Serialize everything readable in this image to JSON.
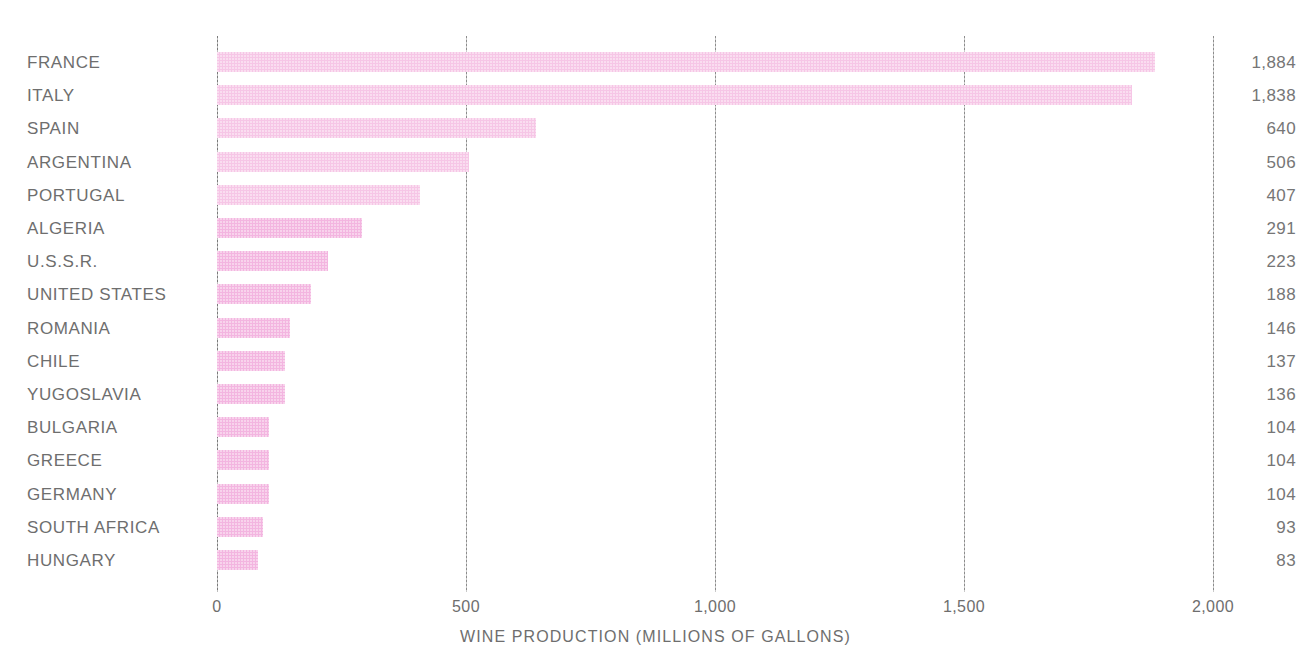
{
  "chart_data": {
    "type": "bar",
    "orientation": "horizontal",
    "title": "",
    "xlabel": "WINE PRODUCTION (MILLIONS OF GALLONS)",
    "ylabel": "",
    "xlim": [
      0,
      2000
    ],
    "xticks": [
      0,
      500,
      1000,
      1500,
      2000
    ],
    "xtick_labels": [
      "0",
      "500",
      "1,000",
      "1,500",
      "2,000"
    ],
    "grid": true,
    "grid_axis": "x",
    "legend": false,
    "value_labels_position": "right-of-plot",
    "bar_color": "#f3b5e0",
    "text_color": "#6e6e6e",
    "categories": [
      "FRANCE",
      "ITALY",
      "SPAIN",
      "ARGENTINA",
      "PORTUGAL",
      "ALGERIA",
      "U.S.S.R.",
      "UNITED STATES",
      "ROMANIA",
      "CHILE",
      "YUGOSLAVIA",
      "BULGARIA",
      "GREECE",
      "GERMANY",
      "SOUTH AFRICA",
      "HUNGARY"
    ],
    "values": [
      1884,
      1838,
      640,
      506,
      407,
      291,
      223,
      188,
      146,
      137,
      136,
      104,
      104,
      104,
      93,
      83
    ],
    "value_labels": [
      "1,884",
      "1,838",
      "640",
      "506",
      "407",
      "291",
      "223",
      "188",
      "146",
      "137",
      "136",
      "104",
      "104",
      "104",
      "93",
      "83"
    ],
    "rows": [
      {
        "label": "FRANCE",
        "value": 1884,
        "value_label": "1,884"
      },
      {
        "label": "ITALY",
        "value": 1838,
        "value_label": "1,838"
      },
      {
        "label": "SPAIN",
        "value": 640,
        "value_label": "640"
      },
      {
        "label": "ARGENTINA",
        "value": 506,
        "value_label": "506"
      },
      {
        "label": "PORTUGAL",
        "value": 407,
        "value_label": "407"
      },
      {
        "label": "ALGERIA",
        "value": 291,
        "value_label": "291"
      },
      {
        "label": "U.S.S.R.",
        "value": 223,
        "value_label": "223"
      },
      {
        "label": "UNITED STATES",
        "value": 188,
        "value_label": "188"
      },
      {
        "label": "ROMANIA",
        "value": 146,
        "value_label": "146"
      },
      {
        "label": "CHILE",
        "value": 137,
        "value_label": "137"
      },
      {
        "label": "YUGOSLAVIA",
        "value": 136,
        "value_label": "136"
      },
      {
        "label": "BULGARIA",
        "value": 104,
        "value_label": "104"
      },
      {
        "label": "GREECE",
        "value": 104,
        "value_label": "104"
      },
      {
        "label": "GERMANY",
        "value": 104,
        "value_label": "104"
      },
      {
        "label": "SOUTH AFRICA",
        "value": 93,
        "value_label": "93"
      },
      {
        "label": "HUNGARY",
        "value": 83,
        "value_label": "83"
      }
    ]
  }
}
